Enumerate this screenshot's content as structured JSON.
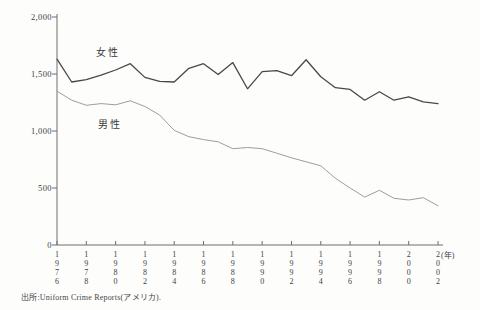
{
  "chart_data": {
    "type": "line",
    "title": "",
    "x_unit_label": "(年)",
    "x": [
      1976,
      1977,
      1978,
      1979,
      1980,
      1981,
      1982,
      1983,
      1984,
      1985,
      1986,
      1987,
      1988,
      1989,
      1990,
      1991,
      1992,
      1993,
      1994,
      1995,
      1996,
      1997,
      1998,
      1999,
      2000,
      2001,
      2002
    ],
    "x_tick_years": [
      "1976",
      "1978",
      "1980",
      "1982",
      "1984",
      "1986",
      "1988",
      "1990",
      "1992",
      "1994",
      "1996",
      "1998",
      "2000",
      "2002"
    ],
    "ylim": [
      0,
      2000
    ],
    "y_ticks": [
      {
        "value": 0,
        "label": "0"
      },
      {
        "value": 500,
        "label": "500"
      },
      {
        "value": 1000,
        "label": "1,000"
      },
      {
        "value": 1500,
        "label": "1,500"
      },
      {
        "value": 2000,
        "label": "2,000"
      }
    ],
    "grid": false,
    "legend": "inline-labels",
    "series": [
      {
        "name": "女性",
        "color": "#484848",
        "values": [
          1630,
          1430,
          1450,
          1490,
          1535,
          1590,
          1470,
          1435,
          1430,
          1550,
          1590,
          1495,
          1600,
          1370,
          1520,
          1530,
          1485,
          1625,
          1475,
          1380,
          1365,
          1270,
          1345,
          1270,
          1300,
          1255,
          1240
        ]
      },
      {
        "name": "男性",
        "color": "#9d9d9d",
        "values": [
          1350,
          1270,
          1225,
          1240,
          1230,
          1265,
          1215,
          1140,
          1005,
          950,
          925,
          905,
          845,
          855,
          845,
          805,
          765,
          730,
          695,
          585,
          500,
          420,
          480,
          410,
          395,
          415,
          345
        ]
      }
    ],
    "source": "出所:Uniform Crime Reports(アメリカ)."
  }
}
